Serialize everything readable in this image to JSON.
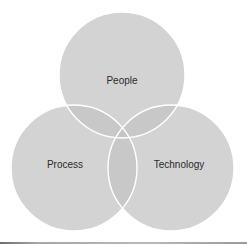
{
  "diagram": {
    "type": "venn",
    "sets": [
      {
        "id": "people",
        "label": "People",
        "cx": 122,
        "cy": 75,
        "r": 63
      },
      {
        "id": "process",
        "label": "Process",
        "cx": 74,
        "cy": 168,
        "r": 63
      },
      {
        "id": "technology",
        "label": "Technology",
        "cx": 171,
        "cy": 168,
        "r": 63
      }
    ],
    "colors": {
      "circle_fill": "#c4c4c4",
      "circle_opacity": "0.75",
      "stroke": "#ffffff",
      "label_text": "#2b2b2b",
      "background": "#ffffff"
    }
  }
}
